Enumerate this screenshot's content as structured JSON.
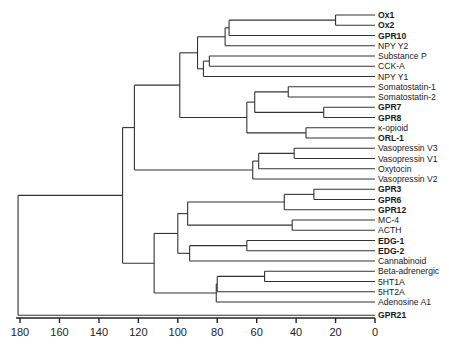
{
  "chart_data": {
    "type": "dendrogram",
    "title": "",
    "xlabel": "",
    "ylabel": "",
    "x_axis": {
      "ticks": [
        180,
        160,
        140,
        120,
        100,
        80,
        60,
        40,
        20,
        0
      ],
      "range": [
        182,
        0
      ],
      "reversed": true
    },
    "grid": false,
    "legend": null,
    "leaves": [
      {
        "label": "Ox1",
        "bold": true
      },
      {
        "label": "Ox2",
        "bold": true
      },
      {
        "label": "GPR10",
        "bold": true
      },
      {
        "label": "NPY Y2",
        "bold": false
      },
      {
        "label": "Substance P",
        "bold": false
      },
      {
        "label": "CCK-A",
        "bold": false
      },
      {
        "label": "NPY Y1",
        "bold": false
      },
      {
        "label": "Somatostatin-1",
        "bold": false
      },
      {
        "label": "Somatostatin-2",
        "bold": false
      },
      {
        "label": "GPR7",
        "bold": true
      },
      {
        "label": "GPR8",
        "bold": true
      },
      {
        "label": "κ-opioid",
        "bold": false
      },
      {
        "label": "ORL-1",
        "bold": true
      },
      {
        "label": "Vasopressin V3",
        "bold": false
      },
      {
        "label": "Vasopressin V1",
        "bold": false
      },
      {
        "label": "Oxytocin",
        "bold": false
      },
      {
        "label": "Vasopressin V2",
        "bold": false
      },
      {
        "label": "GPR3",
        "bold": true
      },
      {
        "label": "GPR6",
        "bold": true
      },
      {
        "label": "GPR12",
        "bold": true
      },
      {
        "label": "MC-4",
        "bold": false
      },
      {
        "label": "ACTH",
        "bold": false
      },
      {
        "label": "EDG-1",
        "bold": true
      },
      {
        "label": "EDG-2",
        "bold": true
      },
      {
        "label": "Cannabinoid",
        "bold": false
      },
      {
        "label": "Beta-adrenergic",
        "bold": false
      },
      {
        "label": "5HT1A",
        "bold": false
      },
      {
        "label": "5HT2A",
        "bold": false
      },
      {
        "label": "Adenosine A1",
        "bold": false
      },
      {
        "label": "GPR21",
        "bold": true
      }
    ],
    "merges": [
      {
        "id": "n1",
        "children": [
          "Ox1",
          "Ox2"
        ],
        "height": 20
      },
      {
        "id": "n2",
        "children": [
          "n1",
          "GPR10"
        ],
        "height": 74
      },
      {
        "id": "n3",
        "children": [
          "n2",
          "NPY Y2"
        ],
        "height": 76
      },
      {
        "id": "n4",
        "children": [
          "Substance P",
          "CCK-A"
        ],
        "height": 84
      },
      {
        "id": "n5",
        "children": [
          "n4",
          "NPY Y1"
        ],
        "height": 87
      },
      {
        "id": "n6",
        "children": [
          "n3",
          "n5"
        ],
        "height": 90
      },
      {
        "id": "n7",
        "children": [
          "Somatostatin-1",
          "Somatostatin-2"
        ],
        "height": 44
      },
      {
        "id": "n8",
        "children": [
          "GPR7",
          "GPR8"
        ],
        "height": 26
      },
      {
        "id": "n9",
        "children": [
          "n7",
          "n8"
        ],
        "height": 61
      },
      {
        "id": "n10",
        "children": [
          "κ-opioid",
          "ORL-1"
        ],
        "height": 35
      },
      {
        "id": "n11",
        "children": [
          "n9",
          "n10"
        ],
        "height": 65
      },
      {
        "id": "n12",
        "children": [
          "n6",
          "n11"
        ],
        "height": 99
      },
      {
        "id": "n13",
        "children": [
          "Vasopressin V3",
          "Vasopressin V1"
        ],
        "height": 41
      },
      {
        "id": "n14",
        "children": [
          "n13",
          "Oxytocin"
        ],
        "height": 59
      },
      {
        "id": "n15",
        "children": [
          "n14",
          "Vasopressin V2"
        ],
        "height": 62
      },
      {
        "id": "n16",
        "children": [
          "n12",
          "n15"
        ],
        "height": 122
      },
      {
        "id": "n17",
        "children": [
          "GPR3",
          "GPR6"
        ],
        "height": 31
      },
      {
        "id": "n18",
        "children": [
          "n17",
          "GPR12"
        ],
        "height": 46
      },
      {
        "id": "n19",
        "children": [
          "MC-4",
          "ACTH"
        ],
        "height": 42
      },
      {
        "id": "n20",
        "children": [
          "n18",
          "n19"
        ],
        "height": 95
      },
      {
        "id": "n21",
        "children": [
          "EDG-1",
          "EDG-2"
        ],
        "height": 65
      },
      {
        "id": "n22",
        "children": [
          "n21",
          "Cannabinoid"
        ],
        "height": 94
      },
      {
        "id": "n23",
        "children": [
          "n20",
          "n22"
        ],
        "height": 100
      },
      {
        "id": "n24",
        "children": [
          "Beta-adrenergic",
          "5HT1A"
        ],
        "height": 56
      },
      {
        "id": "n25",
        "children": [
          "n24",
          "5HT2A"
        ],
        "height": 80
      },
      {
        "id": "n26",
        "children": [
          "n25",
          "Adenosine A1"
        ],
        "height": 80.5
      },
      {
        "id": "n27",
        "children": [
          "n23",
          "n26"
        ],
        "height": 112
      },
      {
        "id": "n28",
        "children": [
          "n16",
          "n27"
        ],
        "height": 128
      },
      {
        "id": "n29",
        "children": [
          "n28",
          "GPR21"
        ],
        "height": 181
      }
    ]
  }
}
